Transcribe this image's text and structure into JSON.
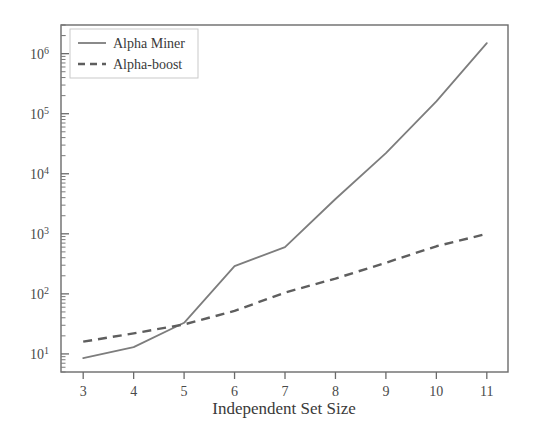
{
  "chart_data": {
    "type": "line",
    "title": "",
    "subtitle": "",
    "xlabel": "Independent Set Size",
    "ylabel": "",
    "x": [
      3,
      4,
      5,
      6,
      7,
      8,
      9,
      10,
      11
    ],
    "xtick_labels": [
      "3",
      "4",
      "5",
      "6",
      "7",
      "8",
      "9",
      "10",
      "11"
    ],
    "xlim": [
      2.56,
      11.42
    ],
    "yscale": "log",
    "ylim": [
      5.0,
      3000000
    ],
    "ytick_labels": [
      "10¹",
      "10²",
      "10³",
      "10⁴",
      "10⁵",
      "10⁶"
    ],
    "ytick_values": [
      10,
      100,
      1000,
      10000,
      100000,
      1000000
    ],
    "ytick_mantissas": [
      "1",
      "2",
      "3",
      "4",
      "5",
      "6"
    ],
    "ytick_base": "10",
    "minor_ticks": true,
    "grid": false,
    "legend_position": "top-left",
    "series": [
      {
        "name": "Alpha Miner",
        "style": "solid",
        "color": "#7d7d7d",
        "values": [
          8.5,
          13,
          33,
          290,
          600,
          3800,
          22000,
          160000,
          1500000
        ]
      },
      {
        "name": "Alpha-boost",
        "style": "dashed",
        "color": "#5e5e5e",
        "values": [
          16,
          22,
          31,
          52,
          105,
          180,
          330,
          620,
          1000
        ]
      }
    ]
  },
  "axes": {
    "x_axis_title": "Independent Set Size",
    "y_axis_title": ""
  },
  "legend": {
    "entries": [
      {
        "label": "Alpha Miner",
        "style": "solid"
      },
      {
        "label": "Alpha-boost",
        "style": "dashed"
      }
    ]
  },
  "colors": {
    "series_solid": "#7d7d7d",
    "series_dashed": "#5e5e5e",
    "frame": "#6b6b6b",
    "text": "#3a3a3a",
    "background": "#ffffff"
  }
}
